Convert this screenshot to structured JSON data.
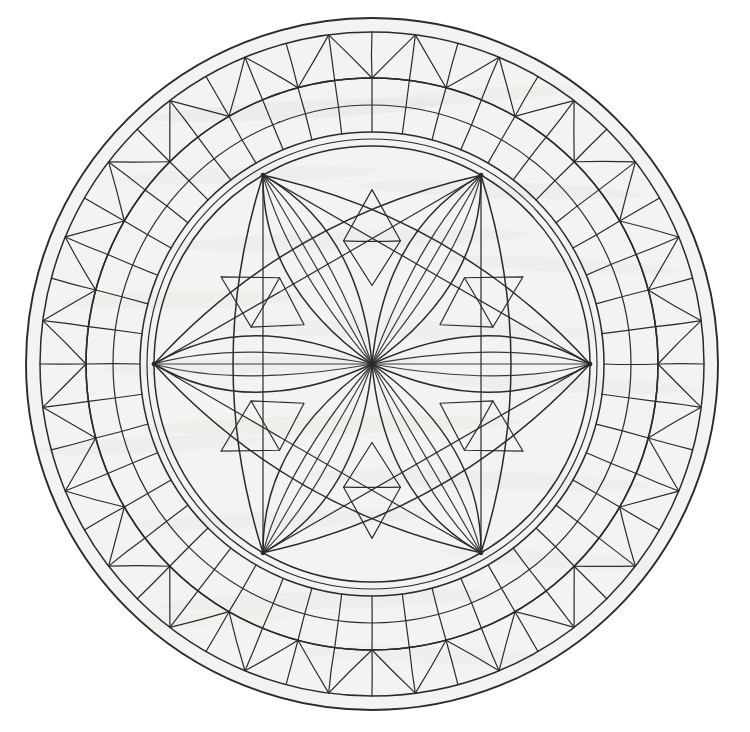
{
  "canvas": {
    "width": 750,
    "height": 732,
    "background_color": "#ffffff",
    "medium": "pencil-and-ink-on-paper",
    "title": "Hand-drawn circular mandala rose window"
  },
  "paper": {
    "fill_color": "#f4f3f1",
    "texture": "graphite-smudge-horizontal-streaks",
    "smudge_color": "#c9c7c4",
    "smudge_opacity": 0.45,
    "streaks": [
      {
        "cx": 300,
        "cy": 110,
        "rx": 150,
        "ry": 9,
        "rot": -3,
        "op": 0.3
      },
      {
        "cx": 470,
        "cy": 96,
        "rx": 110,
        "ry": 7,
        "rot": -4,
        "op": 0.26
      },
      {
        "cx": 250,
        "cy": 175,
        "rx": 130,
        "ry": 8,
        "rot": -2,
        "op": 0.22
      },
      {
        "cx": 500,
        "cy": 190,
        "rx": 140,
        "ry": 8,
        "rot": 2,
        "op": 0.28
      },
      {
        "cx": 350,
        "cy": 240,
        "rx": 180,
        "ry": 9,
        "rot": -2,
        "op": 0.24
      },
      {
        "cx": 560,
        "cy": 265,
        "rx": 120,
        "ry": 7,
        "rot": 3,
        "op": 0.22
      },
      {
        "cx": 180,
        "cy": 300,
        "rx": 120,
        "ry": 8,
        "rot": -1,
        "op": 0.26
      },
      {
        "cx": 420,
        "cy": 330,
        "rx": 200,
        "ry": 9,
        "rot": 1,
        "op": 0.2
      },
      {
        "cx": 260,
        "cy": 365,
        "rx": 160,
        "ry": 8,
        "rot": -2,
        "op": 0.24
      },
      {
        "cx": 570,
        "cy": 385,
        "rx": 130,
        "ry": 8,
        "rot": 2,
        "op": 0.22
      },
      {
        "cx": 330,
        "cy": 425,
        "rx": 190,
        "ry": 9,
        "rot": -1,
        "op": 0.26
      },
      {
        "cx": 150,
        "cy": 445,
        "rx": 110,
        "ry": 8,
        "rot": -3,
        "op": 0.22
      },
      {
        "cx": 480,
        "cy": 480,
        "rx": 170,
        "ry": 9,
        "rot": 2,
        "op": 0.24
      },
      {
        "cx": 280,
        "cy": 520,
        "rx": 150,
        "ry": 8,
        "rot": -2,
        "op": 0.22
      },
      {
        "cx": 560,
        "cy": 560,
        "rx": 120,
        "ry": 8,
        "rot": 4,
        "op": 0.2
      },
      {
        "cx": 330,
        "cy": 600,
        "rx": 170,
        "ry": 9,
        "rot": -2,
        "op": 0.24
      },
      {
        "cx": 430,
        "cy": 655,
        "rx": 130,
        "ry": 8,
        "rot": 2,
        "op": 0.2
      },
      {
        "cx": 200,
        "cy": 620,
        "rx": 100,
        "ry": 7,
        "rot": -3,
        "op": 0.18
      }
    ]
  },
  "ink": {
    "stroke_color": "#2b2b2b",
    "stroke_color_light": "#3a3a3a",
    "line_width_outer": 1.9,
    "line_width_mid": 1.5,
    "line_width_fine": 1.2
  },
  "geometry": {
    "center_x": 372,
    "center_y": 364,
    "radius_outer_rim": 346,
    "radius_outer_rim_inner": 332,
    "radius_zigzag_outer": 332,
    "radius_zigzag_inner": 286,
    "radius_spokes_outer": 286,
    "radius_spokes_inner": 232,
    "radius_inner_ring_a": 232,
    "radius_inner_ring_b": 225,
    "radius_inner_ring_c": 218,
    "radius_flower": 218,
    "outer_sector_count": 48,
    "zigzag_point_count": 24,
    "spoke_count": 48,
    "petal_count": 6,
    "node_count": 6,
    "node_angles_deg": [
      270,
      330,
      30,
      90,
      150,
      210
    ],
    "petal_half_width_deg": 13,
    "petal_inner_line_count": 3,
    "diamond_count": 6,
    "diamond_inner_bar": true
  },
  "structure": {
    "bands": [
      {
        "name": "outer-rim-band",
        "label": "Outer rim double circle",
        "r_out": 346,
        "r_in": 332
      },
      {
        "name": "zigzag-band",
        "label": "Zigzag triangle band",
        "r_out": 332,
        "r_in": 286
      },
      {
        "name": "spoke-band",
        "label": "Radial spoke grid band",
        "r_out": 286,
        "r_in": 232
      },
      {
        "name": "inner-triple-ring",
        "label": "Triple concentric ring",
        "r_out": 232,
        "r_in": 218
      },
      {
        "name": "flower-core",
        "label": "Six-petal rosette core",
        "r_out": 218,
        "r_in": 0
      }
    ],
    "motifs": [
      {
        "name": "six-petal-rosette",
        "label": "Six pointed petals from center"
      },
      {
        "name": "diamond-lozenge",
        "label": "Diamond lozenge between petals"
      },
      {
        "name": "zigzag-triangles",
        "label": "Alternating triangle chevrons"
      },
      {
        "name": "radial-grid",
        "label": "Radial spokes with arc crossbars"
      }
    ]
  },
  "labels": {
    "artwork_name": "Rose Window Mandala"
  }
}
